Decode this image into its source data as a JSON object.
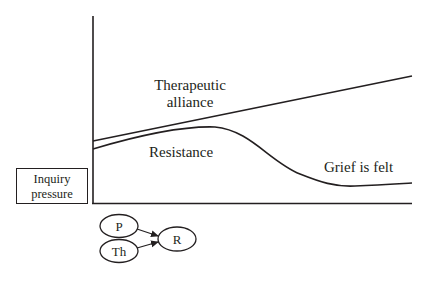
{
  "diagram": {
    "type": "conceptual-line-diagram",
    "colors": {
      "stroke": "#231f20",
      "background": "#ffffff"
    },
    "curves": [
      {
        "name": "therapeutic-alliance",
        "label_line1": "Therapeutic",
        "label_line2": "alliance",
        "trend": "steadily increasing"
      },
      {
        "name": "resistance",
        "label": "Resistance",
        "trend": "rises, peaks, then declines and flattens"
      }
    ],
    "annotations": {
      "grief": "Grief is felt"
    },
    "axis_box": {
      "line1": "Inquiry",
      "line2": "pressure"
    },
    "nodes": [
      {
        "id": "P",
        "label": "P"
      },
      {
        "id": "Th",
        "label": "Th"
      },
      {
        "id": "R",
        "label": "R"
      }
    ],
    "edges": [
      {
        "from": "P",
        "to": "R"
      },
      {
        "from": "Th",
        "to": "R"
      }
    ]
  }
}
